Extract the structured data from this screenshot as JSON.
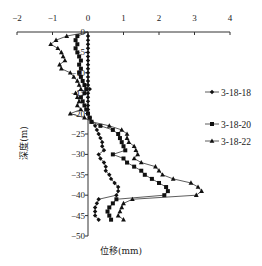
{
  "chart_data": {
    "type": "line",
    "title": "",
    "xlabel": "位移(mm)",
    "ylabel": "深度(m)",
    "xlim": [
      -2,
      4
    ],
    "ylim": [
      -50,
      0
    ],
    "x_ticks": [
      -2,
      -1,
      0,
      1,
      2,
      3,
      4
    ],
    "x_tick_labels": [
      "−2",
      "−1",
      "0",
      "1",
      "2",
      "3",
      "4"
    ],
    "y_ticks": [
      0,
      -5,
      -10,
      -15,
      -20,
      -25,
      -30,
      -35,
      -40,
      -45,
      -50
    ],
    "y_tick_labels": [
      "0",
      "−5",
      "−10",
      "−15",
      "−20",
      "−25",
      "−30",
      "−35",
      "−40",
      "−45",
      "−50"
    ],
    "x_axis_position": "top",
    "grid": false,
    "legend_position": "right",
    "series": [
      {
        "name": "3-18-18",
        "marker": "diamond",
        "depth": [
          -1,
          -2,
          -3,
          -4,
          -5,
          -6,
          -7,
          -8,
          -9,
          -10,
          -11,
          -12,
          -13,
          -14,
          -15,
          -16,
          -17,
          -18,
          -19,
          -20,
          -21,
          -22,
          -23,
          -24,
          -25,
          -26,
          -27,
          -28,
          -29,
          -30,
          -31,
          -32,
          -33,
          -34,
          -35,
          -36,
          -37,
          -38,
          -39,
          -40,
          -41,
          -42,
          -43,
          -44,
          -45,
          -46
        ],
        "values": [
          0.0,
          0.0,
          0.0,
          0.0,
          0.0,
          0.0,
          0.0,
          0.0,
          0.0,
          0.0,
          0.0,
          0.0,
          0.0,
          0.05,
          0.0,
          0.0,
          0.0,
          0.0,
          0.0,
          0.0,
          0.05,
          0.1,
          0.2,
          0.25,
          0.3,
          0.35,
          0.4,
          0.4,
          0.45,
          0.3,
          0.35,
          0.45,
          0.5,
          0.5,
          0.6,
          0.65,
          0.75,
          0.85,
          0.85,
          0.8,
          0.3,
          0.25,
          0.2,
          0.2,
          0.2,
          0.3
        ]
      },
      {
        "name": "3-18-20",
        "marker": "square",
        "depth": [
          -1,
          -2,
          -3,
          -4,
          -5,
          -6,
          -7,
          -8,
          -9,
          -10,
          -11,
          -12,
          -13,
          -14,
          -15,
          -16,
          -17,
          -18,
          -19,
          -20,
          -21,
          -22,
          -23,
          -24,
          -25,
          -26,
          -27,
          -28,
          -29,
          -30,
          -31,
          -32,
          -33,
          -34,
          -35,
          -36,
          -37,
          -38,
          -39,
          -40,
          -41,
          -42,
          -43,
          -44,
          -45,
          -46
        ],
        "values": [
          -0.3,
          -0.35,
          -0.3,
          -0.35,
          -0.3,
          -0.25,
          -0.2,
          -0.25,
          -0.2,
          -0.25,
          -0.2,
          -0.15,
          -0.1,
          -0.05,
          -0.1,
          -0.2,
          -0.15,
          -0.1,
          -0.05,
          0.0,
          0.05,
          0.1,
          0.35,
          0.7,
          0.85,
          0.9,
          0.95,
          1.0,
          1.05,
          0.7,
          1.0,
          1.1,
          1.3,
          1.5,
          1.6,
          1.8,
          2.0,
          2.2,
          2.25,
          2.15,
          0.8,
          0.7,
          0.6,
          0.55,
          0.6,
          0.65
        ]
      },
      {
        "name": "3-18-22",
        "marker": "triangle",
        "depth": [
          -1,
          -2,
          -3,
          -4,
          -5,
          -6,
          -7,
          -8,
          -9,
          -10,
          -11,
          -12,
          -13,
          -14,
          -15,
          -16,
          -17,
          -18,
          -19,
          -20,
          -21,
          -22,
          -23,
          -24,
          -25,
          -26,
          -27,
          -28,
          -29,
          -30,
          -31,
          -32,
          -33,
          -34,
          -35,
          -36,
          -37,
          -38,
          -39,
          -40,
          -41,
          -42,
          -43,
          -44,
          -45,
          -46
        ],
        "values": [
          -0.6,
          -0.9,
          -1.05,
          -0.85,
          -0.75,
          -0.7,
          -0.65,
          -0.8,
          -0.75,
          -0.5,
          -0.4,
          -0.3,
          -0.25,
          -0.2,
          -0.35,
          -0.3,
          -0.25,
          -0.3,
          -0.2,
          -0.5,
          -0.1,
          0.1,
          0.6,
          0.95,
          1.1,
          1.1,
          1.15,
          1.3,
          1.35,
          1.4,
          1.3,
          1.5,
          1.9,
          2.0,
          2.1,
          2.4,
          2.9,
          3.1,
          3.2,
          3.05,
          1.25,
          1.0,
          0.95,
          0.9,
          0.85,
          1.0
        ]
      }
    ]
  }
}
